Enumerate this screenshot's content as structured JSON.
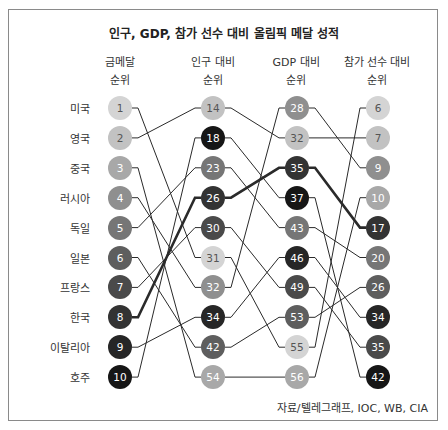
{
  "chart_data": {
    "type": "slope",
    "title": "인구, GDP, 참가 선수 대비 올림픽 메달 성적",
    "columns": [
      "금메달 순위",
      "인구 대비 순위",
      "GDP 대비 순위",
      "참가 선수 대비 순위"
    ],
    "column_lines": [
      [
        "금메달",
        "순위"
      ],
      [
        "인구 대비",
        "순위"
      ],
      [
        "GDP 대비",
        "순위"
      ],
      [
        "참가 선수 대비",
        "순위"
      ]
    ],
    "highlight": "한국",
    "series": [
      {
        "name": "미국",
        "values": [
          1,
          31,
          55,
          6
        ],
        "color": "#d4d4d4"
      },
      {
        "name": "영국",
        "values": [
          2,
          14,
          32,
          7
        ],
        "color": "#c2c2c2"
      },
      {
        "name": "중국",
        "values": [
          3,
          54,
          56,
          10
        ],
        "color": "#a8a8a8"
      },
      {
        "name": "러시아",
        "values": [
          4,
          32,
          28,
          9
        ],
        "color": "#8f8f8f"
      },
      {
        "name": "독일",
        "values": [
          5,
          23,
          43,
          20
        ],
        "color": "#767676"
      },
      {
        "name": "일본",
        "values": [
          6,
          42,
          53,
          26
        ],
        "color": "#5e5e5e"
      },
      {
        "name": "프랑스",
        "values": [
          7,
          30,
          49,
          35
        ],
        "color": "#4a4a4a"
      },
      {
        "name": "한국",
        "values": [
          8,
          26,
          35,
          17
        ],
        "color": "#333333"
      },
      {
        "name": "이탈리아",
        "values": [
          9,
          34,
          46,
          34
        ],
        "color": "#262626"
      },
      {
        "name": "호주",
        "values": [
          10,
          18,
          37,
          42
        ],
        "color": "#161616"
      }
    ],
    "column_order": [
      [
        1,
        2,
        3,
        4,
        5,
        6,
        7,
        8,
        9,
        10
      ],
      [
        14,
        18,
        23,
        26,
        30,
        31,
        32,
        34,
        42,
        54
      ],
      [
        28,
        32,
        35,
        37,
        43,
        46,
        49,
        53,
        55,
        56
      ],
      [
        6,
        7,
        9,
        10,
        17,
        20,
        26,
        34,
        35,
        42
      ]
    ],
    "source": "자료/텔레그래프, IOC, WB, CIA"
  },
  "title": "인구, GDP, 참가 선수 대비 올림픽 메달 성적",
  "headers": [
    {
      "line1": "금메달",
      "line2": "순위"
    },
    {
      "line1": "인구 대비",
      "line2": "순위"
    },
    {
      "line1": "GDP 대비",
      "line2": "순위"
    },
    {
      "line1": "참가 선수 대비",
      "line2": "순위"
    }
  ],
  "source": "자료/텔레그래프, IOC, WB, CIA"
}
